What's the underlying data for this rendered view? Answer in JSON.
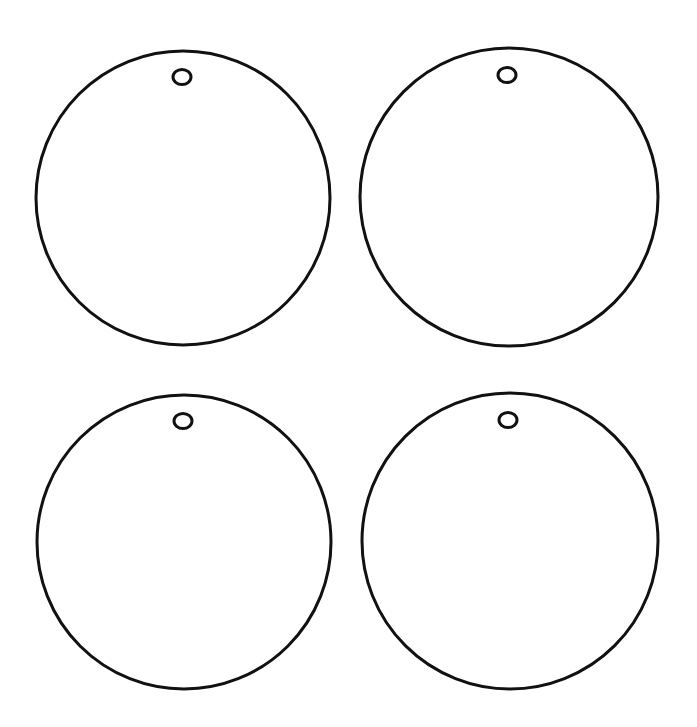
{
  "canvas": {
    "width": 697,
    "height": 727,
    "background": "#ffffff"
  },
  "stroke": {
    "color": "#111111",
    "width": 3
  },
  "ornaments": [
    {
      "cx": 183,
      "cy": 198,
      "r": 147,
      "hole": {
        "cx": 182,
        "cy": 77,
        "rx": 9,
        "ry": 7.5
      }
    },
    {
      "cx": 509,
      "cy": 197,
      "r": 149,
      "hole": {
        "cx": 507,
        "cy": 75,
        "rx": 9,
        "ry": 7.5
      }
    },
    {
      "cx": 184,
      "cy": 542,
      "r": 147,
      "hole": {
        "cx": 183,
        "cy": 421,
        "rx": 9,
        "ry": 7.5
      }
    },
    {
      "cx": 510,
      "cy": 541,
      "r": 148,
      "hole": {
        "cx": 508,
        "cy": 420,
        "rx": 9,
        "ry": 7.5
      }
    }
  ]
}
